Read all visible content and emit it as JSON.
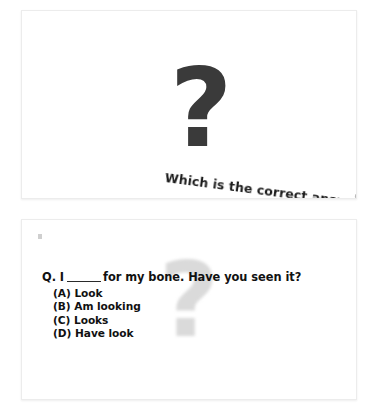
{
  "document": {
    "type": "presentation-slides",
    "background_color": "#ffffff",
    "panel_border_color": "#ececec"
  },
  "slide_top": {
    "name": "title-slide",
    "icon": "question-mark-icon",
    "icon_glyph": "?",
    "icon_color": "#3a3a3a",
    "caption": "Which is the correct answer?",
    "caption_rotation_deg": 7.5
  },
  "slide_bottom": {
    "name": "quiz-slide",
    "watermark_glyph": "?",
    "watermark_color": "#dadada",
    "question": {
      "label": "Q.",
      "text_before_blank": "I",
      "text_after_blank": "for my bone. Have you seen it?",
      "full_text": "Q. I _____ for my bone. Have you seen it?"
    },
    "options": [
      {
        "key": "(A)",
        "label": "Look"
      },
      {
        "key": "(B)",
        "label": "Am looking"
      },
      {
        "key": "(C)",
        "label": "Looks"
      },
      {
        "key": "(D)",
        "label": "Have look"
      }
    ]
  }
}
